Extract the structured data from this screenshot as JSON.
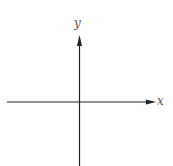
{
  "diagram": {
    "type": "cartesian-axes",
    "x_axis": {
      "label": "x",
      "direction": "right",
      "arrow": true
    },
    "y_axis": {
      "label": "y",
      "direction": "up",
      "arrow": true
    },
    "colors": {
      "axis": "#222222",
      "label": "#555555",
      "background": "#ffffff"
    }
  }
}
